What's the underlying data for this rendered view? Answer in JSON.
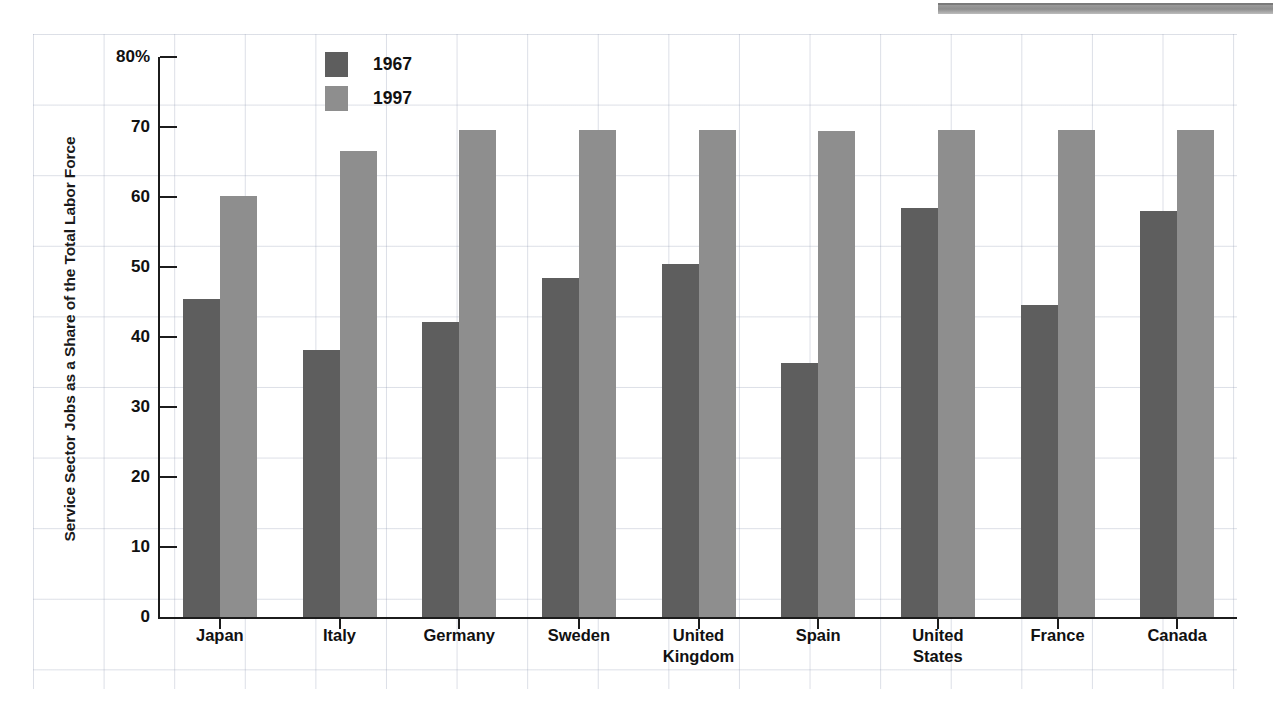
{
  "chart_data": {
    "type": "bar",
    "title": "",
    "xlabel": "",
    "ylabel": "Service Sector Jobs as a Share of the Total Labor Force",
    "ylim": [
      0,
      80
    ],
    "yticks": [
      0,
      10,
      20,
      30,
      40,
      50,
      60,
      70,
      80
    ],
    "ytick_labels": [
      "0",
      "10",
      "20",
      "30",
      "40",
      "50",
      "60",
      "70",
      "80%"
    ],
    "grid": true,
    "legend_position": "top-left-inside",
    "categories": [
      "Japan",
      "Italy",
      "Germany",
      "Sweden",
      "United\nKingdom",
      "Spain",
      "United\nStates",
      "France",
      "Canada"
    ],
    "series": [
      {
        "name": "1967",
        "color": "#5e5e5e",
        "values": [
          45.5,
          38.1,
          42.1,
          48.4,
          50.5,
          36.3,
          58.5,
          44.6,
          58.0
        ]
      },
      {
        "name": "1997",
        "color": "#8e8e8e",
        "values": [
          60.1,
          66.6,
          69.6,
          69.6,
          69.6,
          69.5,
          69.6,
          69.6,
          69.6
        ]
      }
    ]
  },
  "legend": {
    "items": [
      {
        "label": "1967",
        "color": "#5e5e5e"
      },
      {
        "label": "1997",
        "color": "#8e8e8e"
      }
    ]
  },
  "colors": {
    "series_1967": "#5e5e5e",
    "series_1997": "#8e8e8e",
    "axis": "#1c1c1c",
    "grid": "#8c96af",
    "background": "#ffffff"
  }
}
